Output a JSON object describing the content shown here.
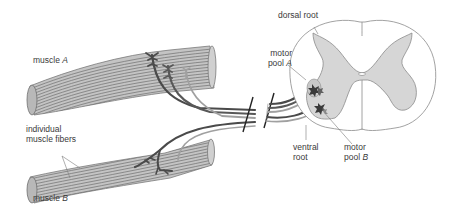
{
  "figure": {
    "colors": {
      "muscle_fill": "#c8c8c8",
      "muscle_stripe": "#7a7a7a",
      "grey_matter": "#d6d6d6",
      "white_matter": "#ffffff",
      "outline": "#8a8a8a",
      "axon_dark": "#505050",
      "axon_light": "#a8a8a8",
      "text": "#3a3a3a"
    }
  },
  "labels": {
    "muscle_a": {
      "text": "muscle ",
      "italic": "A"
    },
    "muscle_b": {
      "text": "muscle ",
      "italic": "B"
    },
    "fibers_line1": "individual",
    "fibers_line2": "muscle fibers",
    "dorsal_root": "dorsal root",
    "motor_pool_a_line1": "motor",
    "motor_pool_a_line2": "pool ",
    "motor_pool_a_italic": "A",
    "ventral_root_line1": "ventral",
    "ventral_root_line2": "root",
    "motor_pool_b_line1": "motor",
    "motor_pool_b_line2": "pool ",
    "motor_pool_b_italic": "B"
  }
}
